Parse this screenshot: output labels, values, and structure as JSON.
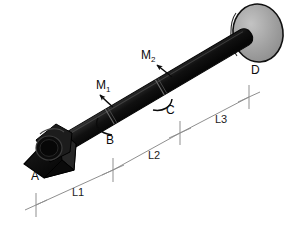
{
  "figure": {
    "type": "engineering-diagram",
    "background_color": "#ffffff",
    "shaft_color": "#161616",
    "disk_color": "#9d9d9d",
    "disk_edge_color": "#141414",
    "dimension_line_color": "#8a8a8a",
    "label_color": "#0b0b0b"
  },
  "points": {
    "a": {
      "label": "A",
      "description": "fixed triangular bracket support at left end"
    },
    "b": {
      "label": "B",
      "description": "section where torque M1 is applied"
    },
    "c": {
      "label": "C",
      "description": "section where torque M2 is applied"
    },
    "d": {
      "label": "D",
      "description": "flange disk at right end"
    }
  },
  "torques": [
    {
      "name": "M1",
      "base": "M",
      "subscript": "1",
      "at": "B"
    },
    {
      "name": "M2",
      "base": "M",
      "subscript": "2",
      "at": "C"
    }
  ],
  "dimensions": [
    {
      "label": "L1",
      "from": "A",
      "to": "B"
    },
    {
      "label": "L2",
      "from": "B",
      "to": "C"
    },
    {
      "label": "L3",
      "from": "C",
      "to": "D"
    }
  ]
}
